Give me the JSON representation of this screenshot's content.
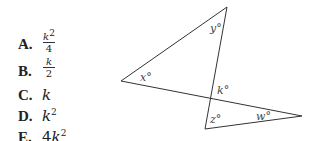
{
  "answer_choices": [
    {
      "letter": "A.",
      "numerator": "k",
      "numerator_exp": "2",
      "denominator": "4"
    },
    {
      "letter": "B.",
      "numerator": "k",
      "denominator": "2"
    },
    {
      "letter": "C.",
      "base": "k"
    },
    {
      "letter": "D.",
      "base": "k",
      "exp": "2"
    },
    {
      "letter": "E.",
      "coef": "4",
      "base": "k",
      "exp": "2"
    }
  ],
  "figure": {
    "labels": {
      "x": "x°",
      "y": "y°",
      "k": "k°",
      "z": "z°",
      "w": "w°"
    }
  }
}
